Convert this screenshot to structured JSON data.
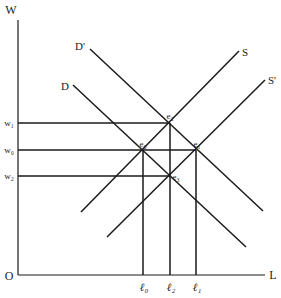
{
  "diagram": {
    "axes": {
      "y_label": "W",
      "x_label": "L",
      "origin_label": "O"
    },
    "wage_levels": [
      {
        "label": "w₁",
        "id": "w1"
      },
      {
        "label": "w₀",
        "id": "w0"
      },
      {
        "label": "w₂",
        "id": "w2"
      }
    ],
    "labor_levels": [
      {
        "label": "ℓ₀",
        "id": "l0"
      },
      {
        "label": "ℓ₂",
        "id": "l2"
      },
      {
        "label": "ℓ₁",
        "id": "l1"
      }
    ],
    "curves": {
      "demand_shifted": "D'",
      "demand": "D",
      "supply": "S",
      "supply_shifted": "S'"
    },
    "equilibria": {
      "e0": "e₀",
      "e1": "e₁",
      "e2": "e₂",
      "e3": "e₃"
    },
    "colors": {
      "line": "#1a1a1a",
      "text": "#222222",
      "background": "#ffffff"
    }
  }
}
